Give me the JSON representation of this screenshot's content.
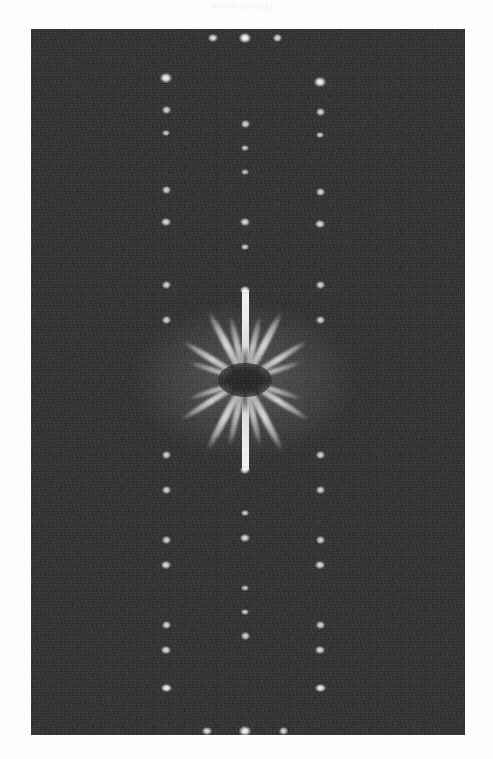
{
  "figure": {
    "kind": "diffraction-pattern",
    "caption_artifact": "bleed-through",
    "panel": {
      "x": 31,
      "y": 29,
      "width": 434,
      "height": 706
    },
    "colors": {
      "page_background": "#fdfdfd",
      "detector_background": "#262626",
      "reflection": "#ffffff",
      "beamstop": "#161616"
    },
    "center": {
      "x": 245,
      "y": 380
    },
    "beamstop": {
      "cx": 245,
      "cy": 380,
      "rx": 27,
      "ry": 17
    }
  },
  "chart_data": {
    "type": "scatter",
    "title": "",
    "subtitle": "",
    "xlabel": "",
    "ylabel": "",
    "grid": false,
    "legend": null,
    "axis_ticks_visible": false,
    "xlim": [
      31,
      465
    ],
    "ylim": [
      29,
      735
    ],
    "lattice": {
      "columns_x": [
        166,
        245,
        320
      ],
      "column_spacing_px": 77,
      "row_spacing_px": 25,
      "symmetry": "centrosymmetric about (245, 380)"
    },
    "series": [
      {
        "name": "central-column reflections",
        "x_px": 245,
        "points": [
          {
            "x": 245,
            "y": 38,
            "r": 5.0,
            "i": 1.0
          },
          {
            "x": 245,
            "y": 124,
            "r": 3.6,
            "i": 0.8
          },
          {
            "x": 245,
            "y": 148,
            "r": 3.4,
            "i": 0.76
          },
          {
            "x": 245,
            "y": 172,
            "r": 3.2,
            "i": 0.72
          },
          {
            "x": 245,
            "y": 222,
            "r": 3.8,
            "i": 0.84
          },
          {
            "x": 245,
            "y": 247,
            "r": 3.4,
            "i": 0.78
          },
          {
            "x": 245,
            "y": 290,
            "r": 4.0,
            "i": 0.88
          },
          {
            "x": 245,
            "y": 470,
            "r": 4.0,
            "i": 0.88
          },
          {
            "x": 245,
            "y": 513,
            "r": 3.4,
            "i": 0.78
          },
          {
            "x": 245,
            "y": 538,
            "r": 3.8,
            "i": 0.84
          },
          {
            "x": 245,
            "y": 588,
            "r": 3.2,
            "i": 0.72
          },
          {
            "x": 245,
            "y": 612,
            "r": 3.4,
            "i": 0.76
          },
          {
            "x": 245,
            "y": 636,
            "r": 3.6,
            "i": 0.8
          },
          {
            "x": 245,
            "y": 731,
            "r": 4.6,
            "i": 0.96
          }
        ]
      },
      {
        "name": "left-column reflections",
        "x_px": 166,
        "points": [
          {
            "x": 166,
            "y": 78,
            "r": 4.6,
            "i": 0.96
          },
          {
            "x": 166,
            "y": 110,
            "r": 3.6,
            "i": 0.8
          },
          {
            "x": 166,
            "y": 133,
            "r": 3.4,
            "i": 0.76
          },
          {
            "x": 166,
            "y": 190,
            "r": 3.6,
            "i": 0.8
          },
          {
            "x": 166,
            "y": 222,
            "r": 3.8,
            "i": 0.84
          },
          {
            "x": 166,
            "y": 285,
            "r": 3.6,
            "i": 0.8
          },
          {
            "x": 166,
            "y": 320,
            "r": 3.6,
            "i": 0.8
          },
          {
            "x": 166,
            "y": 455,
            "r": 3.6,
            "i": 0.8
          },
          {
            "x": 166,
            "y": 490,
            "r": 3.6,
            "i": 0.8
          },
          {
            "x": 166,
            "y": 540,
            "r": 3.6,
            "i": 0.8
          },
          {
            "x": 166,
            "y": 565,
            "r": 3.8,
            "i": 0.84
          },
          {
            "x": 166,
            "y": 625,
            "r": 3.6,
            "i": 0.8
          },
          {
            "x": 166,
            "y": 650,
            "r": 3.8,
            "i": 0.84
          },
          {
            "x": 166,
            "y": 688,
            "r": 4.4,
            "i": 0.94
          }
        ]
      },
      {
        "name": "right-column reflections",
        "x_px": 320,
        "points": [
          {
            "x": 320,
            "y": 82,
            "r": 4.6,
            "i": 0.96
          },
          {
            "x": 320,
            "y": 112,
            "r": 3.6,
            "i": 0.8
          },
          {
            "x": 320,
            "y": 135,
            "r": 3.4,
            "i": 0.76
          },
          {
            "x": 320,
            "y": 192,
            "r": 3.6,
            "i": 0.8
          },
          {
            "x": 320,
            "y": 224,
            "r": 3.8,
            "i": 0.84
          },
          {
            "x": 320,
            "y": 285,
            "r": 3.6,
            "i": 0.8
          },
          {
            "x": 320,
            "y": 320,
            "r": 3.6,
            "i": 0.8
          },
          {
            "x": 320,
            "y": 455,
            "r": 3.6,
            "i": 0.8
          },
          {
            "x": 320,
            "y": 490,
            "r": 3.6,
            "i": 0.8
          },
          {
            "x": 320,
            "y": 540,
            "r": 3.6,
            "i": 0.8
          },
          {
            "x": 320,
            "y": 565,
            "r": 3.8,
            "i": 0.84
          },
          {
            "x": 320,
            "y": 625,
            "r": 3.6,
            "i": 0.8
          },
          {
            "x": 320,
            "y": 650,
            "r": 3.8,
            "i": 0.84
          },
          {
            "x": 320,
            "y": 688,
            "r": 4.4,
            "i": 0.94
          }
        ]
      },
      {
        "name": "top-row reflections",
        "y_px": 38,
        "points": [
          {
            "x": 213,
            "y": 38,
            "r": 3.8,
            "i": 0.86
          },
          {
            "x": 277,
            "y": 38,
            "r": 3.6,
            "i": 0.82
          }
        ]
      },
      {
        "name": "bottom-row reflections",
        "y_px": 731,
        "points": [
          {
            "x": 207,
            "y": 731,
            "r": 3.8,
            "i": 0.86
          },
          {
            "x": 283,
            "y": 731,
            "r": 3.6,
            "i": 0.82
          }
        ]
      }
    ],
    "streaks": [
      {
        "angle_deg": -118,
        "length": 78,
        "thickness": 6.5,
        "i": 0.95
      },
      {
        "angle_deg": -103,
        "length": 66,
        "thickness": 5.5,
        "i": 0.8
      },
      {
        "angle_deg": -148,
        "length": 74,
        "thickness": 6.0,
        "i": 0.9
      },
      {
        "angle_deg": -162,
        "length": 60,
        "thickness": 5.0,
        "i": 0.72
      },
      {
        "angle_deg": -62,
        "length": 78,
        "thickness": 6.5,
        "i": 0.95
      },
      {
        "angle_deg": -77,
        "length": 66,
        "thickness": 5.5,
        "i": 0.8
      },
      {
        "angle_deg": -32,
        "length": 74,
        "thickness": 6.0,
        "i": 0.9
      },
      {
        "angle_deg": -18,
        "length": 60,
        "thickness": 5.0,
        "i": 0.72
      },
      {
        "angle_deg": 118,
        "length": 80,
        "thickness": 6.5,
        "i": 0.95
      },
      {
        "angle_deg": 103,
        "length": 68,
        "thickness": 5.5,
        "i": 0.8
      },
      {
        "angle_deg": 148,
        "length": 76,
        "thickness": 6.0,
        "i": 0.9
      },
      {
        "angle_deg": 162,
        "length": 60,
        "thickness": 5.0,
        "i": 0.72
      },
      {
        "angle_deg": 62,
        "length": 80,
        "thickness": 6.5,
        "i": 0.95
      },
      {
        "angle_deg": 77,
        "length": 68,
        "thickness": 5.5,
        "i": 0.8
      },
      {
        "angle_deg": 32,
        "length": 76,
        "thickness": 6.0,
        "i": 0.9
      },
      {
        "angle_deg": 18,
        "length": 60,
        "thickness": 5.0,
        "i": 0.72
      }
    ],
    "beam_lines": [
      {
        "from_y": 290,
        "to_y": 362,
        "width": 7.0,
        "i": 0.95,
        "direction": "up"
      },
      {
        "from_y": 398,
        "to_y": 470,
        "width": 7.0,
        "i": 0.95,
        "direction": "down"
      }
    ],
    "halo": {
      "cx": 245,
      "cy": 380,
      "rx": 110,
      "ry": 78,
      "i": 0.16
    }
  }
}
